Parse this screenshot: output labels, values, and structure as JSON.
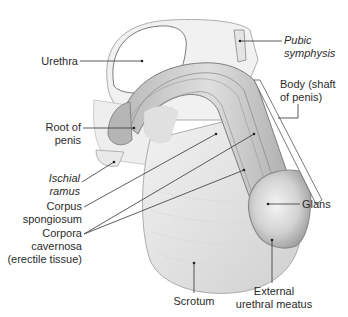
{
  "figure": {
    "labels": {
      "urethra": "Urethra",
      "pubic_symphysis_1": "Pubic",
      "pubic_symphysis_2": "symphysis",
      "body_1": "Body (shaft",
      "body_2": "of penis)",
      "root_1": "Root of",
      "root_2": "penis",
      "ischial_1": "Ischial",
      "ischial_2": "ramus",
      "spongiosum_1": "Corpus",
      "spongiosum_2": "spongiosum",
      "cavernosa_1": "Corpora",
      "cavernosa_2": "cavernosa",
      "cavernosa_3": "(erectile tissue)",
      "glans": "Glans",
      "scrotum": "Scrotum",
      "meatus_1": "External",
      "meatus_2": "urethral meatus"
    },
    "colors": {
      "background": "#ffffff",
      "line": "#333333",
      "tissue_light": "#e9e9e9",
      "tissue_mid": "#cfcfcf",
      "tissue_dark": "#a8a8a8",
      "text": "#2b2b2b"
    }
  }
}
